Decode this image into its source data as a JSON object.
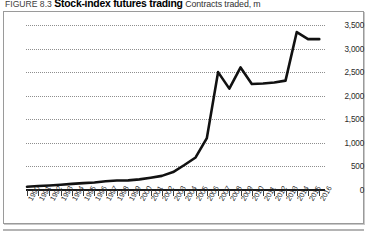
{
  "caption": {
    "figure_number": "FIGURE 8.3",
    "title": "Stock-index futures trading",
    "subtitle": "Contracts traded, m"
  },
  "chart_data": {
    "type": "line",
    "title": "Stock-index futures trading",
    "subtitle": "Contracts traded, m",
    "xlabel": "",
    "ylabel": "Contracts traded, m",
    "grid": true,
    "legend": "none",
    "y_axis_position": "right",
    "ylim": [
      0,
      3500
    ],
    "yticks": [
      0,
      500,
      1000,
      1500,
      2000,
      2500,
      3000,
      3500
    ],
    "ytick_labels": [
      "0",
      "500",
      "1,000",
      "1,500",
      "2,000",
      "2,500",
      "3,000",
      "3,500"
    ],
    "categories": [
      "1990",
      "1991",
      "1992",
      "1993",
      "1994",
      "1995",
      "1996",
      "1997",
      "1998",
      "1999",
      "2000",
      "2001",
      "2002",
      "2003",
      "2004",
      "2005",
      "2006",
      "2007",
      "2008",
      "2009",
      "2010",
      "2011",
      "2012",
      "2013",
      "2014",
      "2015",
      "2016"
    ],
    "values": [
      70,
      85,
      95,
      110,
      130,
      145,
      160,
      185,
      200,
      205,
      225,
      260,
      300,
      380,
      530,
      690,
      1100,
      2500,
      2150,
      2600,
      2250,
      2260,
      2280,
      2320,
      3350,
      3200,
      3200
    ],
    "series": [
      {
        "name": "Contracts traded",
        "color": "#111111",
        "values": [
          70,
          85,
          95,
          110,
          130,
          145,
          160,
          185,
          200,
          205,
          225,
          260,
          300,
          380,
          530,
          690,
          1100,
          2500,
          2150,
          2600,
          2250,
          2260,
          2280,
          2320,
          3350,
          3200,
          3200
        ]
      }
    ]
  }
}
